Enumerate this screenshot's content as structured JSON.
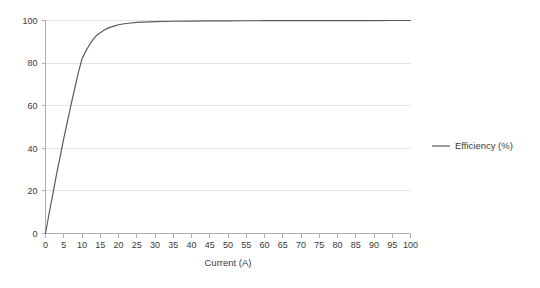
{
  "chart_data": {
    "type": "line",
    "title": "",
    "subtitle": "",
    "xlabel": "Current (A)",
    "ylabel": "",
    "xlim": [
      0,
      100
    ],
    "ylim": [
      0,
      100
    ],
    "grid": true,
    "grid_axis": "y",
    "legend_position": "right",
    "x_ticks": [
      0,
      5,
      10,
      15,
      20,
      25,
      30,
      35,
      40,
      45,
      50,
      55,
      60,
      65,
      70,
      75,
      80,
      85,
      90,
      95,
      100
    ],
    "x_tick_labels": [
      "0",
      "5",
      "10",
      "15",
      "20",
      "25",
      "30",
      "35",
      "40",
      "45",
      "50",
      "55",
      "60",
      "65",
      "70",
      "75",
      "80",
      "85",
      "90",
      "95",
      "100"
    ],
    "y_ticks": [
      0,
      20,
      40,
      60,
      80,
      100
    ],
    "y_tick_labels": [
      "0",
      "20",
      "40",
      "60",
      "80",
      "100"
    ],
    "series": [
      {
        "name": "Efficiency (%)",
        "color": "#5a5a5a",
        "x": [
          0,
          1,
          2,
          3,
          4,
          5,
          6,
          7,
          8,
          9,
          10,
          11,
          12,
          13,
          14,
          15,
          16,
          17,
          18,
          19,
          20,
          22,
          25,
          30,
          35,
          40,
          45,
          50,
          55,
          60,
          65,
          70,
          75,
          80,
          85,
          90,
          95,
          100
        ],
        "values": [
          0,
          9.5,
          18.5,
          27.5,
          36,
          44.5,
          52.5,
          60.5,
          68,
          75.5,
          82,
          85.5,
          88.5,
          91,
          93,
          94.3,
          95.4,
          96.3,
          97,
          97.5,
          98,
          98.6,
          99.1,
          99.5,
          99.65,
          99.75,
          99.8,
          99.85,
          99.88,
          99.9,
          99.92,
          99.94,
          99.95,
          99.96,
          99.97,
          99.98,
          99.99,
          100
        ]
      }
    ],
    "legend_entries": [
      {
        "label": "Efficiency (%)",
        "color": "#5a5a5a",
        "marker": "line"
      }
    ]
  },
  "colors": {
    "background": "#ffffff",
    "grid": "#e3e3e3",
    "axis": "#b0b0b0",
    "text": "#3a3a3a",
    "series": "#5a5a5a"
  }
}
